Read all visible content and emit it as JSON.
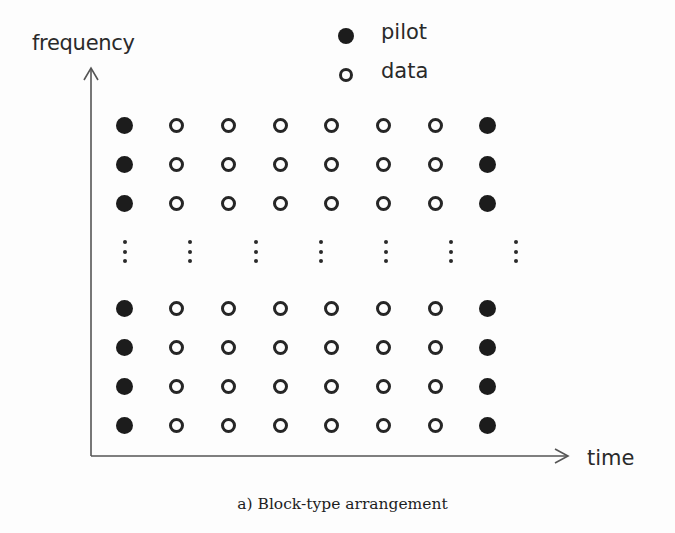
{
  "axes": {
    "y_label": "frequency",
    "x_label": "time"
  },
  "legend": {
    "pilot_label": "pilot",
    "data_label": "data"
  },
  "caption": "a) Block-type arrangement",
  "colors": {
    "pilot_fill": "#1c1c1c",
    "data_stroke": "#262626",
    "axis": "#555555",
    "background": "#fdfdfd"
  },
  "grid": {
    "columns": 8,
    "rows_top": 3,
    "rows_bottom": 4,
    "column_types": [
      "pilot",
      "data",
      "data",
      "data",
      "data",
      "data",
      "data",
      "pilot"
    ],
    "ellipsis_columns": 7,
    "note": "vertical ellipsis between top 3 rows and bottom 4 rows indicates omitted subcarriers"
  },
  "chart_data": {
    "type": "scatter",
    "title": "a) Block-type arrangement",
    "xlabel": "time",
    "ylabel": "frequency",
    "legend": [
      "pilot",
      "data"
    ],
    "series": [
      {
        "name": "pilot",
        "marker": "filled-circle",
        "time_indices": [
          1,
          8
        ],
        "frequency_rows": [
          1,
          2,
          3,
          "...",
          4,
          5,
          6,
          7
        ]
      },
      {
        "name": "data",
        "marker": "open-circle",
        "time_indices": [
          2,
          3,
          4,
          5,
          6,
          7
        ],
        "frequency_rows": [
          1,
          2,
          3,
          "...",
          4,
          5,
          6,
          7
        ]
      }
    ],
    "grid": false
  }
}
